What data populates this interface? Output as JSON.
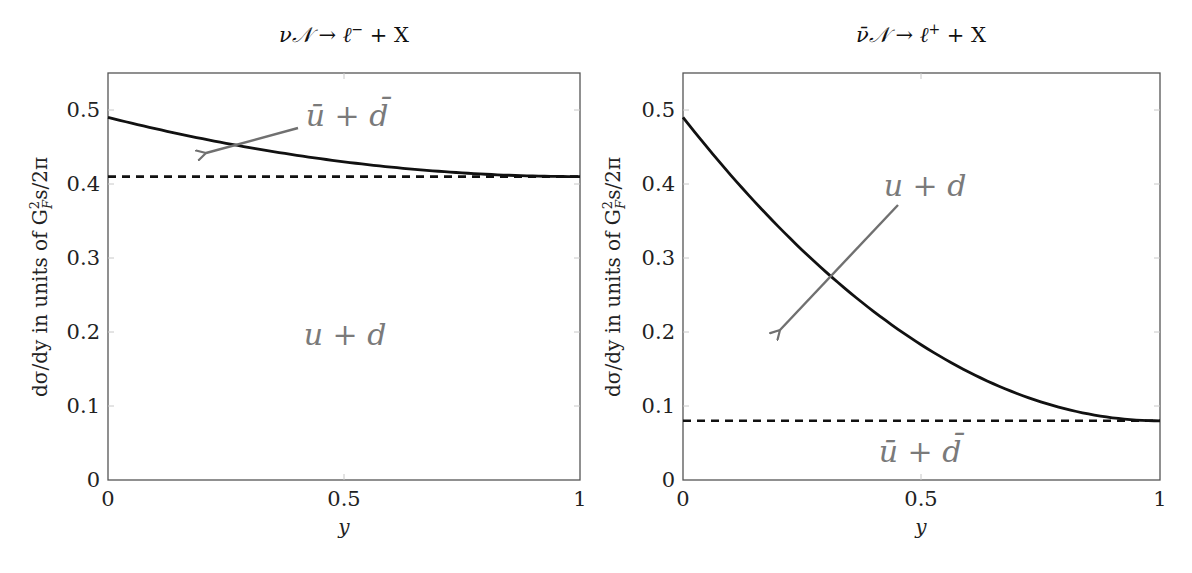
{
  "chart_data": [
    {
      "type": "line",
      "title": "νN → ℓ⁻ + X",
      "xlabel": "y",
      "ylabel": "dσ/dy in units of G_F² s/2π",
      "xlim": [
        0,
        1
      ],
      "ylim": [
        0,
        0.55
      ],
      "xticks": [
        "0",
        "0.5",
        "1"
      ],
      "yticks": [
        "0",
        "0.1",
        "0.2",
        "0.3",
        "0.4",
        "0.5"
      ],
      "grid": false,
      "series": [
        {
          "name": "total (u + d + ū(1-y)² ... )",
          "style": "solid",
          "formula": "0.41 + 0.08(1-y)^2",
          "x": [
            0,
            0.1,
            0.2,
            0.3,
            0.4,
            0.5,
            0.6,
            0.7,
            0.8,
            0.9,
            1.0
          ],
          "values": [
            0.49,
            0.4748,
            0.4612,
            0.4492,
            0.4388,
            0.43,
            0.4228,
            0.4172,
            0.4132,
            0.4108,
            0.41
          ]
        },
        {
          "name": "u + d",
          "style": "dashed",
          "x": [
            0,
            1
          ],
          "values": [
            0.41,
            0.41
          ]
        }
      ],
      "annotations": [
        {
          "text": "ū + d̄",
          "points_to": "gap between solid and dashed curves",
          "arrow": true
        },
        {
          "text": "u + d",
          "position": "below dashed line",
          "arrow": false
        }
      ]
    },
    {
      "type": "line",
      "title": "ν̄N → ℓ⁺ + X",
      "xlabel": "y",
      "ylabel": "dσ/dy in units of G_F² s/2π",
      "xlim": [
        0,
        1
      ],
      "ylim": [
        0,
        0.55
      ],
      "xticks": [
        "0",
        "0.5",
        "1"
      ],
      "yticks": [
        "0",
        "0.1",
        "0.2",
        "0.3",
        "0.4",
        "0.5"
      ],
      "grid": false,
      "series": [
        {
          "name": "total",
          "style": "solid",
          "formula": "0.08 + 0.41(1-y)^2",
          "x": [
            0,
            0.1,
            0.2,
            0.3,
            0.4,
            0.5,
            0.6,
            0.7,
            0.8,
            0.9,
            1.0
          ],
          "values": [
            0.49,
            0.4121,
            0.3424,
            0.2809,
            0.2276,
            0.1825,
            0.1456,
            0.1169,
            0.0964,
            0.0841,
            0.08
          ]
        },
        {
          "name": "ū + d̄",
          "style": "dashed",
          "x": [
            0,
            1
          ],
          "values": [
            0.08,
            0.08
          ]
        }
      ],
      "annotations": [
        {
          "text": "u + d",
          "points_to": "gap between solid and dashed curves",
          "arrow": true
        },
        {
          "text": "ū + d̄",
          "position": "below dashed line",
          "arrow": false
        }
      ]
    }
  ],
  "left": {
    "title_main": "ν𝒩 → ℓ",
    "title_sup": "−",
    "title_tail": " + X",
    "xlabel": "y",
    "ylabel_main": "dσ/dy in units of G",
    "ylabel_sub": "F",
    "ylabel_sup": "2",
    "ylabel_tail": "s/2π",
    "annot_arrow": "ū + d̄",
    "annot_area": "u + d",
    "xticks": [
      "0",
      "0.5",
      "1"
    ],
    "yticks": [
      "0",
      "0.1",
      "0.2",
      "0.3",
      "0.4",
      "0.5"
    ]
  },
  "right": {
    "title_main": "ν̄𝒩 → ℓ",
    "title_sup": "+",
    "title_tail": " + X",
    "xlabel": "y",
    "ylabel_main": "dσ/dy in units of G",
    "ylabel_sub": "F",
    "ylabel_sup": "2",
    "ylabel_tail": "s/2π",
    "annot_arrow": "u + d",
    "annot_area": "ū + d̄",
    "xticks": [
      "0",
      "0.5",
      "1"
    ],
    "yticks": [
      "0",
      "0.1",
      "0.2",
      "0.3",
      "0.4",
      "0.5"
    ]
  }
}
